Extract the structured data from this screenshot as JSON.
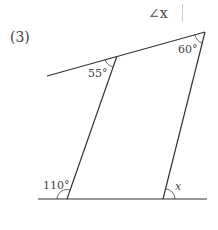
{
  "question": {
    "prompt_symbol": "∠x",
    "number": "(3)"
  },
  "diagram": {
    "angles": [
      {
        "id": "top-inner",
        "label": "55°"
      },
      {
        "id": "top-right",
        "label": "60°"
      },
      {
        "id": "bottom-left-exterior",
        "label": "110°"
      },
      {
        "id": "bottom-right",
        "label": "x"
      }
    ],
    "line_color": "#333333",
    "text_color": "#444444"
  }
}
